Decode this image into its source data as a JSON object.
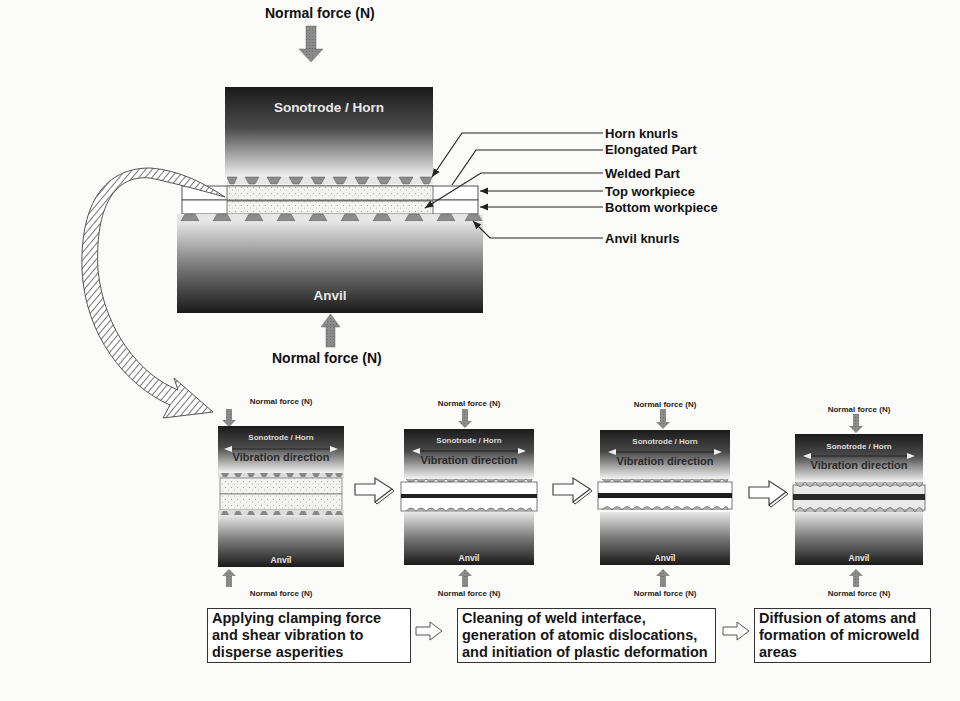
{
  "figure": {
    "main_diagram": {
      "top_force_label": "Normal force (N)",
      "bottom_force_label": "Normal force (N)",
      "horn_label": "Sonotrode / Horn",
      "anvil_label": "Anvil",
      "callouts": [
        {
          "label": "Horn knurls"
        },
        {
          "label": "Elongated Part"
        },
        {
          "label": "Welded Part"
        },
        {
          "label": "Top workpiece"
        },
        {
          "label": "Bottom workpiece"
        },
        {
          "label": "Anvil knurls"
        }
      ]
    },
    "stages": [
      {
        "top_force": "Normal force (N)",
        "horn": "Sonotrode / Horn",
        "vibration": "Vibration direction",
        "anvil": "Anvil",
        "bottom_force": "Normal force (N)"
      },
      {
        "top_force": "Normal force (N)",
        "horn": "Sonotrode / Horn",
        "vibration": "Vibration direction",
        "anvil": "Anvil",
        "bottom_force": "Normal force (N)"
      },
      {
        "top_force": "Normal force (N)",
        "horn": "Sonotrode / Horn",
        "vibration": "Vibration direction",
        "anvil": "Anvil",
        "bottom_force": "Normal force (N)"
      },
      {
        "top_force": "Normal force (N)",
        "horn": "Sonotrode / Horn",
        "vibration": "Vibration direction",
        "anvil": "Anvil",
        "bottom_force": "Normal force (N)"
      }
    ],
    "phase_boxes": [
      {
        "text": "Applying clamping force and shear vibration to disperse asperities"
      },
      {
        "text": "Cleaning of weld interface, generation of atomic dislocations, and initiation of plastic deformation"
      },
      {
        "text": "Diffusion of atoms and formation of microweld areas"
      }
    ],
    "colors": {
      "block_dark": "#1e1e1e",
      "block_light": "#f2f2f2",
      "arrow_gray": "#8a8a8a",
      "border": "#333333"
    }
  }
}
